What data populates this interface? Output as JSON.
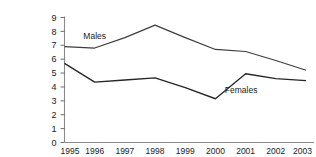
{
  "chart_data": {
    "type": "line",
    "title": "",
    "xlabel": "",
    "ylabel": "",
    "categories": [
      "1995",
      "1996",
      "1997",
      "1998",
      "1999",
      "2000",
      "2001",
      "2002",
      "2003"
    ],
    "x": [
      1995,
      1996,
      1997,
      1998,
      1999,
      2000,
      2001,
      2002,
      2003
    ],
    "ylim": [
      0,
      9
    ],
    "xlim": [
      1995,
      2003
    ],
    "y_ticks": [
      "0",
      "1",
      "2",
      "3",
      "4",
      "5",
      "6",
      "7",
      "8",
      "9"
    ],
    "grid": false,
    "legend_position": "inline-annotation",
    "series": [
      {
        "name": "Males",
        "color": "#3d3d3d",
        "values": [
          6.9,
          6.8,
          7.55,
          8.45,
          7.55,
          6.7,
          6.55,
          5.9,
          5.2
        ]
      },
      {
        "name": "Females",
        "color": "#262626",
        "values": [
          5.7,
          4.35,
          4.5,
          4.65,
          3.95,
          3.15,
          4.95,
          4.6,
          4.45
        ]
      }
    ],
    "annotations": [
      {
        "text": "Males",
        "x": 1996.0,
        "y": 7.45
      },
      {
        "text": "Females",
        "x": 2000.85,
        "y": 3.55
      }
    ]
  },
  "axis": {
    "axis_color": "#8a8a8a",
    "tick_color": "#6f6f6f"
  }
}
